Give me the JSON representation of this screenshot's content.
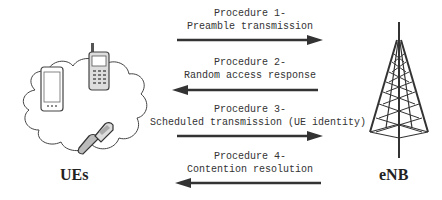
{
  "diagram": {
    "nodes": {
      "left": {
        "label": "UEs",
        "icon": "mobile-phones-cloud-icon"
      },
      "right": {
        "label": "eNB",
        "icon": "cell-tower-icon"
      }
    },
    "procedures": [
      {
        "title": "Procedure 1-",
        "description": "Preamble transmission",
        "direction": "UEs -> eNB"
      },
      {
        "title": "Procedure 2-",
        "description": "Random access response",
        "direction": "eNB -> UEs"
      },
      {
        "title": "Procedure 3-",
        "description": "Scheduled transmission (UE identity)",
        "direction": "UEs -> eNB"
      },
      {
        "title": "Procedure 4-",
        "description": "Contention resolution",
        "direction": "eNB -> UEs"
      }
    ],
    "colors": {
      "arrow": "#333333",
      "text": "#333333",
      "background": "#ffffff"
    }
  }
}
